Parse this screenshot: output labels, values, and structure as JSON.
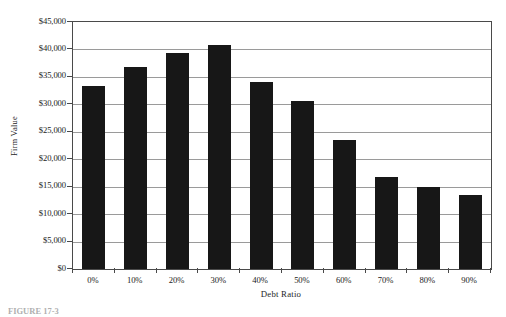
{
  "chart_data": {
    "type": "bar",
    "title": "",
    "subtitle": "",
    "xlabel": "Debt Ratio",
    "ylabel": "Firm Value",
    "categories": [
      "0%",
      "10%",
      "20%",
      "30%",
      "40%",
      "50%",
      "60%",
      "70%",
      "80%",
      "90%"
    ],
    "values": [
      33400,
      36800,
      39400,
      40900,
      34000,
      30700,
      23500,
      16800,
      15000,
      13400
    ],
    "series": [
      {
        "name": "Firm Value",
        "values": [
          33400,
          36800,
          39400,
          40900,
          34000,
          30700,
          23500,
          16800,
          15000,
          13400
        ]
      }
    ],
    "ylim": [
      0,
      45000
    ],
    "ytick_values": [
      0,
      5000,
      10000,
      15000,
      20000,
      25000,
      30000,
      35000,
      40000,
      45000
    ],
    "ytick_labels": [
      "$0",
      "$5,000",
      "$10,000",
      "$15,000",
      "$20,000",
      "$25,000",
      "$30,000",
      "$35,000",
      "$40,000",
      "$45,000"
    ],
    "grid": true,
    "grid_axis": "y",
    "legend": false,
    "legend_position": "none",
    "bar_color": "#171717",
    "gridline_color": "#9a9a9a",
    "frame_color": "#4a4a4a",
    "background_color": "#ffffff"
  },
  "axes": {
    "y_title": "Firm Value",
    "x_title": "Debt Ratio"
  },
  "caption": {
    "label": "FIGURE 17-3",
    "text": ""
  }
}
